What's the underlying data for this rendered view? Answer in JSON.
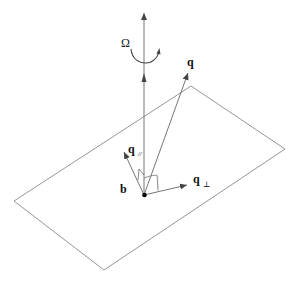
{
  "diagram": {
    "title": "",
    "colors": {
      "background": "#ffffff",
      "plane": "#8a8a8a",
      "vector": "#555555",
      "text": "#111111",
      "origin": "#000000"
    },
    "labels": {
      "omega": "Ω",
      "q": "q",
      "q_parallel_base": "q",
      "q_parallel_sub": "//",
      "b": "b",
      "q_perp_base": "q",
      "q_perp_sub": "⊥"
    },
    "elements": [
      {
        "id": "plane",
        "type": "parallelogram",
        "points": [
          [
            191,
            86
          ],
          [
            285,
            149
          ],
          [
            104,
            270
          ],
          [
            14,
            201
          ]
        ]
      },
      {
        "id": "rotation-axis",
        "type": "arrow",
        "from": [
          144,
          195
        ],
        "to": [
          144,
          13
        ],
        "label": "Ω"
      },
      {
        "id": "q-vector",
        "type": "arrow",
        "from": [
          144,
          195
        ],
        "to": [
          188,
          73
        ],
        "label": "q"
      },
      {
        "id": "q-parallel",
        "type": "arrow",
        "from": [
          144,
          195
        ],
        "to": [
          144,
          75
        ],
        "label": "q//"
      },
      {
        "id": "b-vector",
        "type": "arrow",
        "from": [
          144,
          195
        ],
        "to": [
          124,
          152
        ],
        "label": "b"
      },
      {
        "id": "q-perp",
        "type": "arrow",
        "from": [
          144,
          195
        ],
        "to": [
          187,
          184
        ],
        "label": "q⊥"
      },
      {
        "id": "origin",
        "type": "point",
        "at": [
          144,
          195
        ]
      }
    ]
  }
}
